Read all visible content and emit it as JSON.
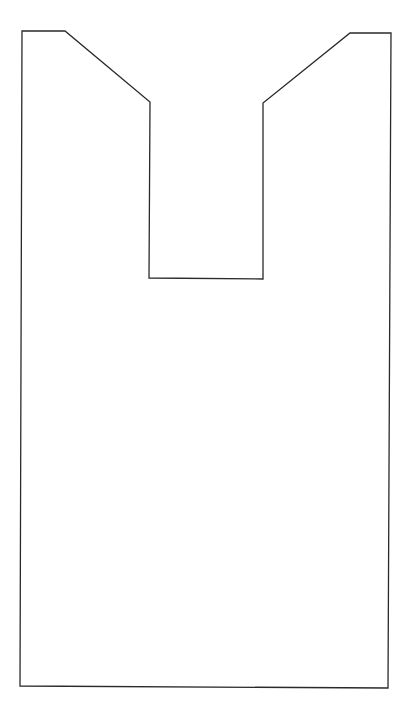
{
  "diagram": {
    "description": "Outline drawing of a bag-like shape: a tall rectangle with a rectangular notch cut from the top center, with the notch shoulders slanting inward",
    "shape": "bag-outline",
    "line_color": "#2a2a2a",
    "background_color": "#ffffff",
    "text_labels": []
  }
}
